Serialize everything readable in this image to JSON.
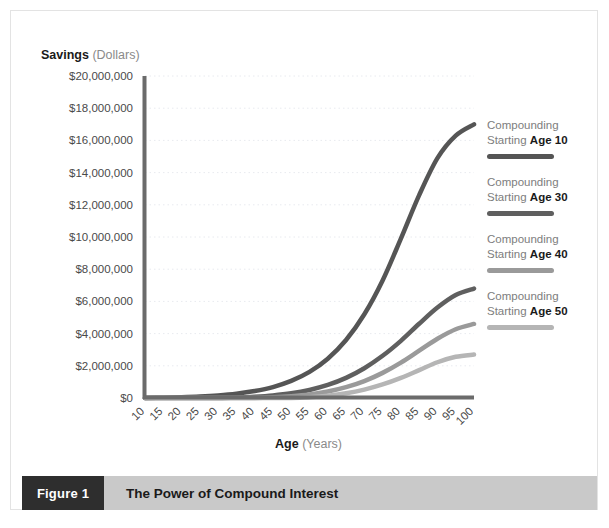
{
  "figure": {
    "tag": "Figure 1",
    "caption": "The Power of Compound Interest"
  },
  "axes": {
    "y_title_bold": "Savings",
    "y_title_rest": " (Dollars)",
    "x_title_bold": "Age",
    "x_title_rest": " (Years)"
  },
  "legend": {
    "items": [
      {
        "line1": "Compounding",
        "line2_prefix": "Starting ",
        "line2_bold": "Age 10",
        "color": "#555555"
      },
      {
        "line1": "Compounding",
        "line2_prefix": "Starting ",
        "line2_bold": "Age 30",
        "color": "#5f5f5f"
      },
      {
        "line1": "Compounding",
        "line2_prefix": "Starting ",
        "line2_bold": "Age 40",
        "color": "#9a9a9a"
      },
      {
        "line1": "Compounding",
        "line2_prefix": "Starting ",
        "line2_bold": "Age 50",
        "color": "#b5b5b5"
      }
    ]
  },
  "chart_data": {
    "type": "line",
    "title": "The Power of Compound Interest",
    "xlabel": "Age (Years)",
    "ylabel": "Savings (Dollars)",
    "xlim": [
      10,
      100
    ],
    "ylim": [
      0,
      20000000
    ],
    "grid": true,
    "legend_position": "right",
    "x": [
      10,
      15,
      20,
      25,
      30,
      35,
      40,
      45,
      50,
      55,
      60,
      65,
      70,
      75,
      80,
      85,
      90,
      95,
      100
    ],
    "xtick_labels": [
      "10",
      "15",
      "20",
      "25",
      "30",
      "35",
      "40",
      "45",
      "50",
      "55",
      "60",
      "65",
      "70",
      "75",
      "80",
      "85",
      "90",
      "95",
      "100"
    ],
    "ytick_values": [
      0,
      2000000,
      4000000,
      6000000,
      8000000,
      10000000,
      12000000,
      14000000,
      16000000,
      18000000,
      20000000
    ],
    "ytick_labels": [
      "$0",
      "$2,000,000",
      "$4,000,000",
      "$6,000,000",
      "$8,000,000",
      "$10,000,000",
      "$12,000,000",
      "$14,000,000",
      "$16,000,000",
      "$18,000,000",
      "$20,000,000"
    ],
    "series": [
      {
        "name": "Compounding Starting Age 10",
        "color": "#555555",
        "values": [
          0,
          20000,
          48000,
          92000,
          160000,
          265000,
          430000,
          680000,
          1060000,
          1620000,
          2440000,
          3600000,
          5200000,
          7300000,
          9900000,
          12600000,
          14900000,
          16300000,
          17000000
        ]
      },
      {
        "name": "Compounding Starting Age 30",
        "color": "#5f5f5f",
        "values": [
          0,
          0,
          0,
          0,
          0,
          30000,
          80000,
          160000,
          290000,
          500000,
          810000,
          1250000,
          1850000,
          2620000,
          3550000,
          4610000,
          5620000,
          6400000,
          6800000
        ]
      },
      {
        "name": "Compounding Starting Age 40",
        "color": "#9a9a9a",
        "values": [
          0,
          0,
          0,
          0,
          0,
          0,
          0,
          40000,
          110000,
          220000,
          400000,
          670000,
          1050000,
          1560000,
          2200000,
          2940000,
          3680000,
          4270000,
          4600000
        ]
      },
      {
        "name": "Compounding Starting Age 50",
        "color": "#b5b5b5",
        "values": [
          0,
          0,
          0,
          0,
          0,
          0,
          0,
          0,
          0,
          50000,
          140000,
          290000,
          520000,
          840000,
          1250000,
          1730000,
          2220000,
          2560000,
          2700000
        ]
      }
    ]
  }
}
